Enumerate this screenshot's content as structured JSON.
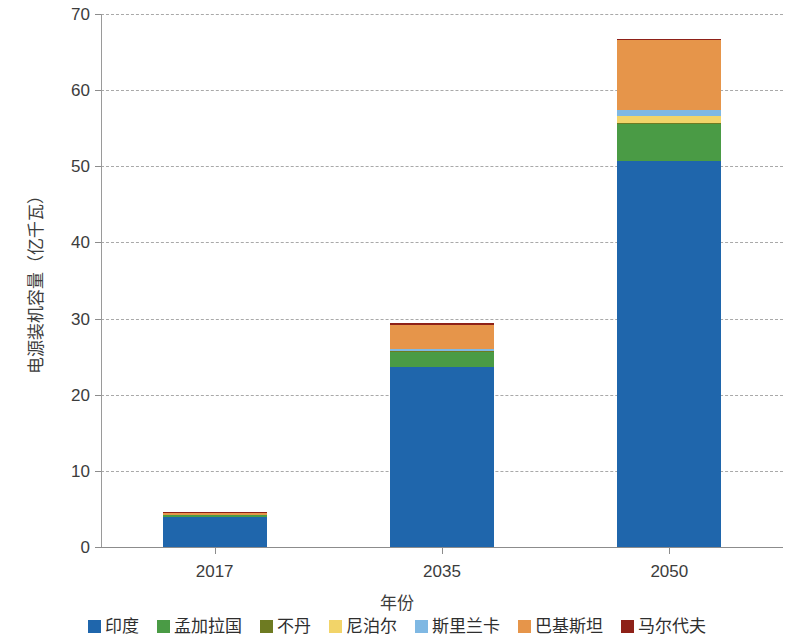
{
  "chart_data": {
    "type": "bar",
    "subtype": "stacked-bar",
    "title": "",
    "xlabel": "年份",
    "ylabel": "电源装机容量（亿千瓦）",
    "categories": [
      "2017",
      "2035",
      "2050"
    ],
    "ylim": [
      0,
      70
    ],
    "yticks": [
      0,
      10,
      20,
      30,
      40,
      50,
      60,
      70
    ],
    "grid": "horizontal-dashed",
    "legend_position": "bottom",
    "series": [
      {
        "name": "印度",
        "color": "#1f66ac",
        "values": [
          4.0,
          23.7,
          50.7
        ]
      },
      {
        "name": "孟加拉国",
        "color": "#4a9b45",
        "values": [
          0.15,
          1.9,
          4.9
        ]
      },
      {
        "name": "不丹",
        "color": "#6e7b22",
        "values": [
          0.02,
          0.08,
          0.15
        ]
      },
      {
        "name": "尼泊尔",
        "color": "#f2d469",
        "values": [
          0.03,
          0.12,
          0.8
        ]
      },
      {
        "name": "斯里兰卡",
        "color": "#7fb8e3",
        "values": [
          0.05,
          0.2,
          0.8
        ]
      },
      {
        "name": "巴基斯坦",
        "color": "#e6954a",
        "values": [
          0.25,
          3.2,
          9.2
        ]
      },
      {
        "name": "马尔代夫",
        "color": "#8e2118",
        "values": [
          0.005,
          0.01,
          0.03
        ]
      }
    ],
    "totals": [
      4.5,
      29.2,
      66.6
    ]
  },
  "axes": {
    "y_title": "电源装机容量（亿千瓦）",
    "x_title": "年份",
    "y_tick_labels": [
      "70",
      "60",
      "50",
      "40",
      "30",
      "20",
      "10",
      "0"
    ],
    "x_tick_labels": [
      "2017",
      "2035",
      "2050"
    ]
  },
  "legend": {
    "items": [
      {
        "label": "印度",
        "color": "#1f66ac"
      },
      {
        "label": "孟加拉国",
        "color": "#4a9b45"
      },
      {
        "label": "不丹",
        "color": "#6e7b22"
      },
      {
        "label": "尼泊尔",
        "color": "#f2d469"
      },
      {
        "label": "斯里兰卡",
        "color": "#7fb8e3"
      },
      {
        "label": "巴基斯坦",
        "color": "#e6954a"
      },
      {
        "label": "马尔代夫",
        "color": "#8e2118"
      }
    ]
  }
}
